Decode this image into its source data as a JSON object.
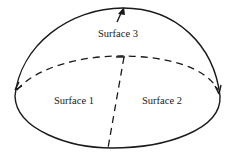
{
  "diagram": {
    "type": "hemisphere",
    "labels": {
      "surface_top": "Surface 3",
      "surface_left": "Surface 1",
      "surface_right": "Surface 2"
    },
    "stroke_color": "#1a1a1a",
    "background_color": "#ffffff"
  }
}
